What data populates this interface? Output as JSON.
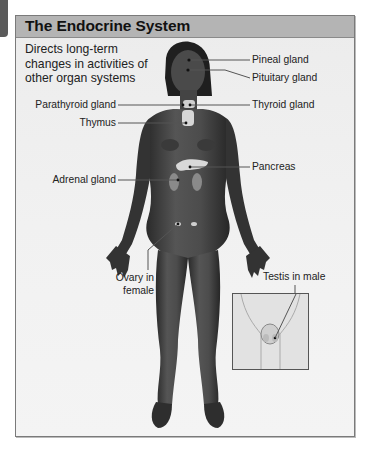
{
  "page": {
    "title": "The Endocrine System",
    "description_lines": [
      "Directs long-term",
      "changes in activities of",
      "other organ systems"
    ]
  },
  "labels": {
    "pineal": "Pineal gland",
    "pituitary": "Pituitary gland",
    "parathyroid": "Parathyroid gland",
    "thyroid": "Thyroid gland",
    "thymus": "Thymus",
    "pancreas": "Pancreas",
    "adrenal": "Adrenal gland",
    "ovary_line1": "Ovary in",
    "ovary_line2": "female",
    "testis": "Testis in male"
  },
  "colors": {
    "header_bg": "#b4b4b4",
    "panel_bg": "#efefef",
    "figure_skin": "#3a3a3a",
    "gland": "#d8d8d8",
    "leader_line": "#555555"
  }
}
